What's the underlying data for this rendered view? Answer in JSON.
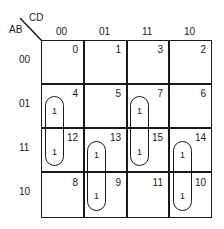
{
  "kmap": {
    "row_var": "AB",
    "col_var": "CD",
    "col_labels": [
      "00",
      "01",
      "11",
      "10"
    ],
    "row_labels": [
      "00",
      "01",
      "11",
      "10"
    ],
    "cells": [
      [
        "0",
        "1",
        "3",
        "2"
      ],
      [
        "4",
        "5",
        "7",
        "6"
      ],
      [
        "12",
        "13",
        "15",
        "14"
      ],
      [
        "8",
        "9",
        "11",
        "10"
      ]
    ],
    "ones": [
      {
        "cell": "4",
        "value": "1"
      },
      {
        "cell": "12",
        "value": "1"
      },
      {
        "cell": "7",
        "value": "1"
      },
      {
        "cell": "15",
        "value": "1"
      },
      {
        "cell": "13",
        "value": "1"
      },
      {
        "cell": "9",
        "value": "1"
      },
      {
        "cell": "14",
        "value": "1"
      },
      {
        "cell": "10",
        "value": "1"
      }
    ],
    "groups": [
      {
        "cells": [
          "4",
          "12"
        ]
      },
      {
        "cells": [
          "7",
          "15"
        ]
      },
      {
        "cells": [
          "13",
          "9"
        ]
      },
      {
        "cells": [
          "14",
          "10"
        ]
      }
    ]
  }
}
